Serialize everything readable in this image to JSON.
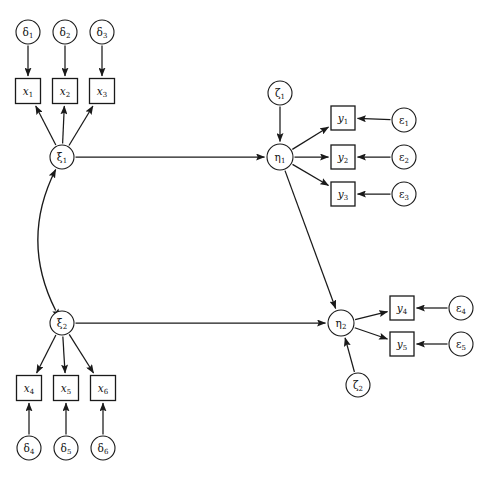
{
  "figure": {
    "kind": "sem-path-diagram",
    "width": 490,
    "height": 481,
    "background_color": "#ffffff",
    "stroke_color": "#1a1a1a",
    "text_color": "#111111"
  },
  "nodes": {
    "delta1": {
      "label": "δ",
      "sub": "1",
      "shape": "circle",
      "cx": 28,
      "cy": 32,
      "r": 12
    },
    "delta2": {
      "label": "δ",
      "sub": "2",
      "shape": "circle",
      "cx": 65,
      "cy": 32,
      "r": 12
    },
    "delta3": {
      "label": "δ",
      "sub": "3",
      "shape": "circle",
      "cx": 102,
      "cy": 32,
      "r": 12
    },
    "x1": {
      "label": "x",
      "sub": "1",
      "shape": "box",
      "cx": 28,
      "cy": 91,
      "w": 25,
      "h": 25
    },
    "x2": {
      "label": "x",
      "sub": "2",
      "shape": "box",
      "cx": 65,
      "cy": 91,
      "w": 25,
      "h": 25
    },
    "x3": {
      "label": "x",
      "sub": "3",
      "shape": "box",
      "cx": 102,
      "cy": 91,
      "w": 25,
      "h": 25
    },
    "xi1": {
      "label": "ξ",
      "sub": "1",
      "shape": "circle",
      "cx": 62,
      "cy": 157,
      "r": 12
    },
    "xi2": {
      "label": "ξ",
      "sub": "2",
      "shape": "circle",
      "cx": 62,
      "cy": 323,
      "r": 12
    },
    "x4": {
      "label": "x",
      "sub": "4",
      "shape": "box",
      "cx": 29,
      "cy": 388,
      "w": 25,
      "h": 25
    },
    "x5": {
      "label": "x",
      "sub": "5",
      "shape": "box",
      "cx": 66,
      "cy": 388,
      "w": 25,
      "h": 25
    },
    "x6": {
      "label": "x",
      "sub": "6",
      "shape": "box",
      "cx": 103,
      "cy": 388,
      "w": 25,
      "h": 25
    },
    "delta4": {
      "label": "δ",
      "sub": "4",
      "shape": "circle",
      "cx": 29,
      "cy": 448,
      "r": 12
    },
    "delta5": {
      "label": "δ",
      "sub": "5",
      "shape": "circle",
      "cx": 66,
      "cy": 448,
      "r": 12
    },
    "delta6": {
      "label": "δ",
      "sub": "6",
      "shape": "circle",
      "cx": 103,
      "cy": 448,
      "r": 12
    },
    "zeta1": {
      "label": "ζ",
      "sub": "1",
      "shape": "circle",
      "cx": 280,
      "cy": 93,
      "r": 12
    },
    "eta1": {
      "label": "η",
      "sub": "1",
      "shape": "circle",
      "cx": 280,
      "cy": 157,
      "r": 13
    },
    "eta2": {
      "label": "η",
      "sub": "2",
      "shape": "circle",
      "cx": 341,
      "cy": 323,
      "r": 13
    },
    "zeta2": {
      "label": "ζ",
      "sub": "2",
      "shape": "circle",
      "cx": 358,
      "cy": 385,
      "r": 12
    },
    "y1": {
      "label": "y",
      "sub": "1",
      "shape": "box",
      "cx": 343,
      "cy": 118,
      "w": 24,
      "h": 24
    },
    "y2": {
      "label": "y",
      "sub": "2",
      "shape": "box",
      "cx": 343,
      "cy": 157,
      "w": 24,
      "h": 24
    },
    "y3": {
      "label": "y",
      "sub": "3",
      "shape": "box",
      "cx": 343,
      "cy": 194,
      "w": 24,
      "h": 24
    },
    "y4": {
      "label": "y",
      "sub": "4",
      "shape": "box",
      "cx": 402,
      "cy": 308,
      "w": 24,
      "h": 24
    },
    "y5": {
      "label": "y",
      "sub": "5",
      "shape": "box",
      "cx": 402,
      "cy": 344,
      "w": 24,
      "h": 24
    },
    "eps1": {
      "label": "ε",
      "sub": "1",
      "shape": "circle",
      "cx": 404,
      "cy": 120,
      "r": 12
    },
    "eps2": {
      "label": "ε",
      "sub": "2",
      "shape": "circle",
      "cx": 404,
      "cy": 157,
      "r": 12
    },
    "eps3": {
      "label": "ε",
      "sub": "3",
      "shape": "circle",
      "cx": 404,
      "cy": 194,
      "r": 12
    },
    "eps4": {
      "label": "ε",
      "sub": "4",
      "shape": "circle",
      "cx": 461,
      "cy": 308,
      "r": 12
    },
    "eps5": {
      "label": "ε",
      "sub": "5",
      "shape": "circle",
      "cx": 461,
      "cy": 344,
      "r": 12
    }
  },
  "node_order": [
    "delta1",
    "delta2",
    "delta3",
    "x1",
    "x2",
    "x3",
    "xi1",
    "xi2",
    "x4",
    "x5",
    "x6",
    "delta4",
    "delta5",
    "delta6",
    "zeta1",
    "eta1",
    "eta2",
    "zeta2",
    "y1",
    "y2",
    "y3",
    "y4",
    "y5",
    "eps1",
    "eps2",
    "eps3",
    "eps4",
    "eps5"
  ],
  "edges": [
    {
      "name": "delta1-to-x1",
      "from": "delta1",
      "to": "x1",
      "style": "straight",
      "arrows": "end"
    },
    {
      "name": "delta2-to-x2",
      "from": "delta2",
      "to": "x2",
      "style": "straight",
      "arrows": "end"
    },
    {
      "name": "delta3-to-x3",
      "from": "delta3",
      "to": "x3",
      "style": "straight",
      "arrows": "end"
    },
    {
      "name": "xi1-to-x1",
      "from": "xi1",
      "to": "x1",
      "style": "straight",
      "arrows": "end"
    },
    {
      "name": "xi1-to-x2",
      "from": "xi1",
      "to": "x2",
      "style": "straight",
      "arrows": "end"
    },
    {
      "name": "xi1-to-x3",
      "from": "xi1",
      "to": "x3",
      "style": "straight",
      "arrows": "end"
    },
    {
      "name": "xi1-to-eta1",
      "from": "xi1",
      "to": "eta1",
      "style": "straight",
      "arrows": "end"
    },
    {
      "name": "xi2-to-x4",
      "from": "xi2",
      "to": "x4",
      "style": "straight",
      "arrows": "end"
    },
    {
      "name": "xi2-to-x5",
      "from": "xi2",
      "to": "x5",
      "style": "straight",
      "arrows": "end"
    },
    {
      "name": "xi2-to-x6",
      "from": "xi2",
      "to": "x6",
      "style": "straight",
      "arrows": "end"
    },
    {
      "name": "delta4-to-x4",
      "from": "delta4",
      "to": "x4",
      "style": "straight",
      "arrows": "end"
    },
    {
      "name": "delta5-to-x5",
      "from": "delta5",
      "to": "x5",
      "style": "straight",
      "arrows": "end"
    },
    {
      "name": "delta6-to-x6",
      "from": "delta6",
      "to": "x6",
      "style": "straight",
      "arrows": "end"
    },
    {
      "name": "xi2-to-eta2",
      "from": "xi2",
      "to": "eta2",
      "style": "straight",
      "arrows": "end"
    },
    {
      "name": "xi1-covariance-xi2",
      "from": "xi2",
      "to": "xi1",
      "style": "curve",
      "bow": -42,
      "arrows": "both"
    },
    {
      "name": "zeta1-to-eta1",
      "from": "zeta1",
      "to": "eta1",
      "style": "straight",
      "arrows": "end"
    },
    {
      "name": "zeta2-to-eta2",
      "from": "zeta2",
      "to": "eta2",
      "style": "straight",
      "arrows": "end"
    },
    {
      "name": "eta1-to-y1",
      "from": "eta1",
      "to": "y1",
      "style": "straight",
      "arrows": "end"
    },
    {
      "name": "eta1-to-y2",
      "from": "eta1",
      "to": "y2",
      "style": "straight",
      "arrows": "end"
    },
    {
      "name": "eta1-to-y3",
      "from": "eta1",
      "to": "y3",
      "style": "straight",
      "arrows": "end"
    },
    {
      "name": "eta1-to-eta2",
      "from": "eta1",
      "to": "eta2",
      "style": "straight",
      "arrows": "end"
    },
    {
      "name": "eta2-to-y4",
      "from": "eta2",
      "to": "y4",
      "style": "straight",
      "arrows": "end"
    },
    {
      "name": "eta2-to-y5",
      "from": "eta2",
      "to": "y5",
      "style": "straight",
      "arrows": "end"
    },
    {
      "name": "eps1-to-y1",
      "from": "eps1",
      "to": "y1",
      "style": "straight",
      "arrows": "end"
    },
    {
      "name": "eps2-to-y2",
      "from": "eps2",
      "to": "y2",
      "style": "straight",
      "arrows": "end"
    },
    {
      "name": "eps3-to-y3",
      "from": "eps3",
      "to": "y3",
      "style": "straight",
      "arrows": "end"
    },
    {
      "name": "eps4-to-y4",
      "from": "eps4",
      "to": "y4",
      "style": "straight",
      "arrows": "end"
    },
    {
      "name": "eps5-to-y5",
      "from": "eps5",
      "to": "y5",
      "style": "straight",
      "arrows": "end"
    }
  ]
}
